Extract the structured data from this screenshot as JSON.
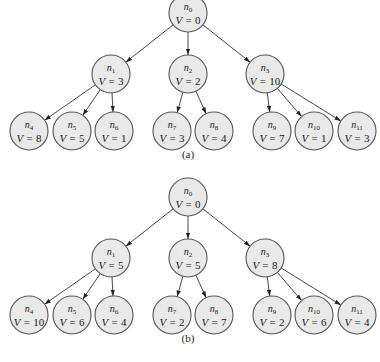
{
  "trees": [
    {
      "caption": "(a)",
      "nodes": [
        {
          "id": "n0",
          "name": "n",
          "sub": "0",
          "v": "0"
        },
        {
          "id": "n1",
          "name": "n",
          "sub": "1",
          "v": "3"
        },
        {
          "id": "n2",
          "name": "n",
          "sub": "2",
          "v": "2"
        },
        {
          "id": "n3",
          "name": "n",
          "sub": "3",
          "v": "10"
        },
        {
          "id": "n4",
          "name": "n",
          "sub": "4",
          "v": "8"
        },
        {
          "id": "n5",
          "name": "n",
          "sub": "5",
          "v": "5"
        },
        {
          "id": "n6",
          "name": "n",
          "sub": "6",
          "v": "1"
        },
        {
          "id": "n7",
          "name": "n",
          "sub": "7",
          "v": "3"
        },
        {
          "id": "n8",
          "name": "n",
          "sub": "8",
          "v": "4"
        },
        {
          "id": "n9",
          "name": "n",
          "sub": "9",
          "v": "7"
        },
        {
          "id": "n10",
          "name": "n",
          "sub": "10",
          "v": "1"
        },
        {
          "id": "n11",
          "name": "n",
          "sub": "11",
          "v": "3"
        }
      ]
    },
    {
      "caption": "(b)",
      "nodes": [
        {
          "id": "n0",
          "name": "n",
          "sub": "0",
          "v": "0"
        },
        {
          "id": "n1",
          "name": "n",
          "sub": "1",
          "v": "5"
        },
        {
          "id": "n2",
          "name": "n",
          "sub": "2",
          "v": "5"
        },
        {
          "id": "n3",
          "name": "n",
          "sub": "3",
          "v": "8"
        },
        {
          "id": "n4",
          "name": "n",
          "sub": "4",
          "v": "10"
        },
        {
          "id": "n5",
          "name": "n",
          "sub": "5",
          "v": "6"
        },
        {
          "id": "n6",
          "name": "n",
          "sub": "6",
          "v": "4"
        },
        {
          "id": "n7",
          "name": "n",
          "sub": "7",
          "v": "2"
        },
        {
          "id": "n8",
          "name": "n",
          "sub": "8",
          "v": "7"
        },
        {
          "id": "n9",
          "name": "n",
          "sub": "9",
          "v": "2"
        },
        {
          "id": "n10",
          "name": "n",
          "sub": "10",
          "v": "6"
        },
        {
          "id": "n11",
          "name": "n",
          "sub": "11",
          "v": "4"
        }
      ]
    }
  ],
  "edges": [
    [
      "n0",
      "n1"
    ],
    [
      "n0",
      "n2"
    ],
    [
      "n0",
      "n3"
    ],
    [
      "n1",
      "n4"
    ],
    [
      "n1",
      "n5"
    ],
    [
      "n1",
      "n6"
    ],
    [
      "n2",
      "n7"
    ],
    [
      "n2",
      "n8"
    ],
    [
      "n3",
      "n9"
    ],
    [
      "n3",
      "n10"
    ],
    [
      "n3",
      "n11"
    ]
  ],
  "v_prefix": "V = "
}
